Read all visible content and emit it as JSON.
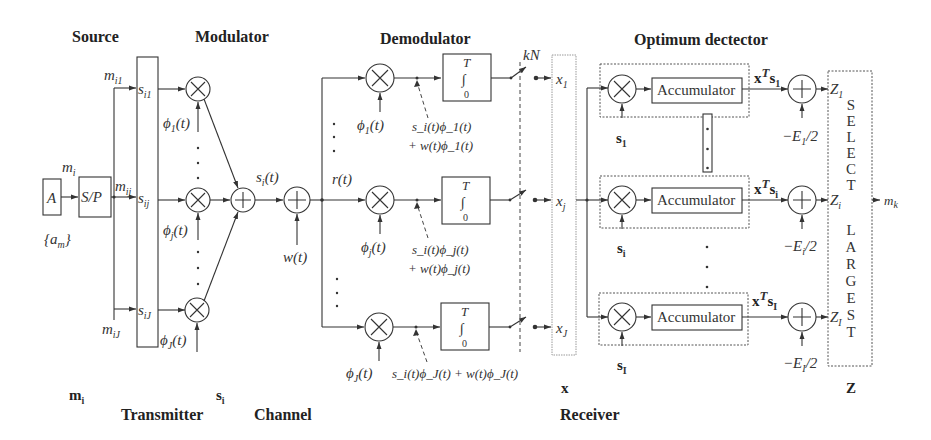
{
  "section_titles": {
    "source": "Source",
    "modulator": "Modulator",
    "demodulator": "Demodulator",
    "optimum_detector": "Optimum dectector"
  },
  "bottom_labels": {
    "m_i": "m",
    "m_i_sub": "i",
    "s_i": "s",
    "s_i_sub": "i",
    "x": "x",
    "z": "Z",
    "transmitter": "Transmitter",
    "channel": "Channel",
    "receiver": "Receiver"
  },
  "source": {
    "a_block": "A",
    "sp_block": "S/P",
    "am_label": "{a",
    "am_sub": "m",
    "am_close": "}",
    "mi_label": "m",
    "mi_sub": "i",
    "m_i1": "m",
    "m_i1_sub": "i1",
    "m_ij": "m",
    "m_ij_sub": "ij",
    "m_iJ": "m",
    "m_iJ_sub": "iJ"
  },
  "transmitter_vector": {
    "s_i1": "s",
    "s_i1_sub": "i1",
    "s_ij": "s",
    "s_ij_sub": "ij",
    "s_iJ": "s",
    "s_iJ_sub": "iJ"
  },
  "modulator": {
    "phi_1": "ϕ",
    "phi_1_sub": "1",
    "phi_j": "ϕ",
    "phi_j_sub": "j",
    "phi_J": "ϕ",
    "phi_J_sub": "J",
    "t_suffix": "(t)",
    "multiply_symbol": "×",
    "sum_symbol": "+",
    "output": "s",
    "output_sub": "i",
    "output_suffix": "(t)"
  },
  "channel": {
    "noise": "w(t)",
    "received": "r(t)",
    "sum_symbol": "+"
  },
  "demodulator": {
    "integrator_upper": "T",
    "integrator_lower": "0",
    "integral_symbol": "∫",
    "sampler": "kN",
    "branches": [
      {
        "phi": "ϕ",
        "phi_sub": "1",
        "signal_line1": "s_i(t)ϕ_1(t)",
        "signal_line2": "+ w(t)ϕ_1(t)",
        "output": "x",
        "output_sub": "1"
      },
      {
        "phi": "ϕ",
        "phi_sub": "j",
        "signal_line1": "s_i(t)ϕ_j(t)",
        "signal_line2": "+ w(t)ϕ_j(t)",
        "output": "x",
        "output_sub": "j"
      },
      {
        "phi": "ϕ",
        "phi_sub": "J",
        "signal_line1": "s_i(t)ϕ_J(t) + w(t)ϕ_J(t)",
        "signal_line2": "",
        "output": "x",
        "output_sub": "J"
      }
    ]
  },
  "detector": {
    "branches": [
      {
        "accumulator": "Accumulator",
        "s": "s",
        "s_sub": "1",
        "xts": "x",
        "xts_sup": "T",
        "xts_s": "s",
        "xts_sub": "1",
        "bias": "−E",
        "bias_sub": "1",
        "bias_suffix": "/2",
        "z": "Z",
        "z_sub": "1"
      },
      {
        "accumulator": "Accumulator",
        "s": "s",
        "s_sub": "i",
        "xts": "x",
        "xts_sup": "T",
        "xts_s": "s",
        "xts_sub": "i",
        "bias": "−E",
        "bias_sub": "i",
        "bias_suffix": "/2",
        "z": "Z",
        "z_sub": "i"
      },
      {
        "accumulator": "Accumulator",
        "s": "s",
        "s_sub": "I",
        "xts": "x",
        "xts_sup": "T",
        "xts_s": "s",
        "xts_sub": "I",
        "bias": "−E",
        "bias_sub": "I",
        "bias_suffix": "/2",
        "z": "Z",
        "z_sub": "I"
      }
    ],
    "select_letters": [
      "S",
      "E",
      "L",
      "E",
      "C",
      "T"
    ],
    "largest_letters": [
      "L",
      "A",
      "R",
      "G",
      "E",
      "S",
      "T"
    ],
    "output": "m",
    "output_sub": "k"
  }
}
